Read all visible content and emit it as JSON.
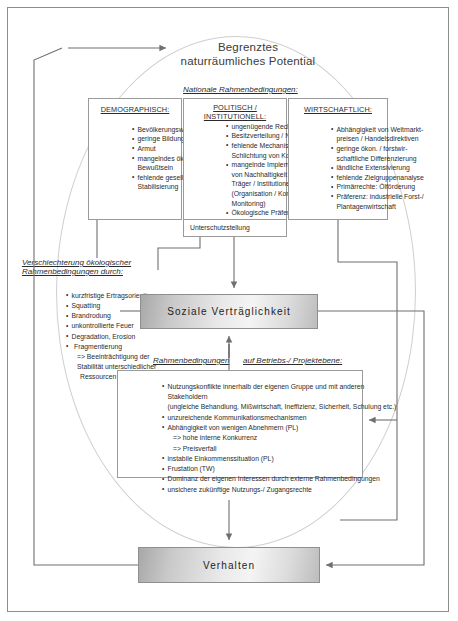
{
  "diagram": {
    "title_line1": "Begrenztes",
    "title_line2": "naturräumliches Potential",
    "national_heading": "Nationale Rahmenbedingungen:",
    "columns": [
      {
        "id": "demographisch",
        "heading": "DEMOGRAPHISCH:",
        "items": [
          "Bevölkerungswachstum",
          "geringe Bildung",
          "Armut",
          "mangelndes ökologisches",
          "Bewußtsein",
          "fehlende gesellschaftliche",
          "Stabilisierung"
        ]
      },
      {
        "id": "politisch-institutionell",
        "heading": "POLITISCH / INSTITUTIONELL:",
        "items": [
          "ungenügende Rechtssicherheit",
          "Besitzverteilung / Nutzrechte",
          "fehlende Mechanismen zur",
          "Schlichtung von Konflikten",
          "mangelnde Implementierung",
          "von Nachhaltigkeit durch staatl.",
          "Träger / Institutionen",
          "(Organisation / Konzeption /",
          "Monitoring)",
          "Ökologische Präferenz:",
          "Unterschutzstellung"
        ]
      },
      {
        "id": "wirtschaftlich",
        "heading": "WIRTSCHAFTLICH:",
        "items": [
          "Abhängigkeit von Weltmarkt-",
          "preisen / Handelsdirektiven",
          "geringe ökon. / forstwir-",
          "schaftliche Differenzierung",
          "ländliche Extensivierung",
          "fehlende Zielgruppenanalyse",
          "Primärrechte: Ölförderung",
          "Präferenz: industrielle Forst-/",
          "Plantagenwirtschaft"
        ]
      }
    ],
    "left_block": {
      "heading_line1": "Verschlechterung ökologischer",
      "heading_line2": "Rahmenbedingungen durch:",
      "items": [
        "kurzfristige Ertragsorientierung",
        "Squatting",
        "Brandrodung",
        "unkontrollierte Feuer",
        "Degradation, Erosion",
        "Fragmentierung",
        "=> Beeinträchtigung der",
        "Stabilität unterschiedlicher",
        "Ressourcen"
      ]
    },
    "center_box_label": "Soziale  Verträglichkeit",
    "project_heading_part1": "Rahmenbedingungen",
    "project_heading_part2": "auf Betriebs-/ Projektebene:",
    "project_items": [
      "Nutzungskonflikte innerhalb der eigenen Gruppe und mit anderen Stakeholdern",
      "(ungleiche Behandlung, Mißwirtschaft, Ineffizienz, Sicherheit, Schulung  etc.)",
      "unzureichende Kommunikationsmechanismen",
      "Abhängigkeit von wenigen Abnehmern (PL)",
      "=> hohe interne Konkurrenz",
      "=> Preisverfall",
      "instabile Einkommenssituation (PL)",
      "Frustation (TW)",
      "Dominanz der eigenen Interessen durch externe  Rahmenbedingungen",
      "unsichere zukünftige Nutzungs-/ Zugangsrechte"
    ],
    "bottom_box_label": "Verhalten",
    "colors": {
      "frame": "#8d8d8d",
      "line": "#6f6f6f",
      "ellipse": "#cfcfcf",
      "box_border": "#9a9a9a",
      "text": "#2b2b2b"
    }
  }
}
